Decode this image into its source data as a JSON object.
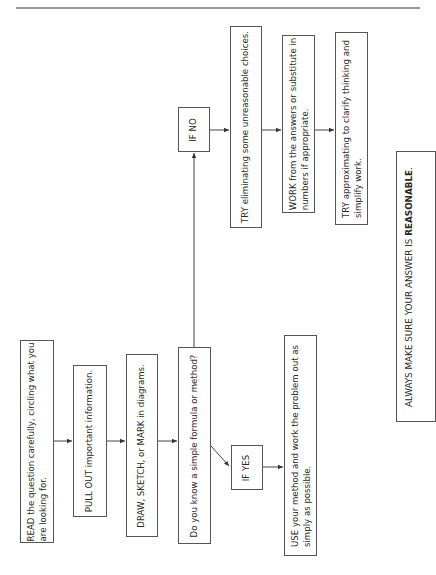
{
  "diagram": {
    "title": "",
    "orientation": "rotated-90-ccw",
    "nodes": [
      {
        "id": "read",
        "lines": [
          "READ the question carefully, circling what you",
          "are looking for."
        ]
      },
      {
        "id": "pull",
        "lines": [
          "PULL OUT important information."
        ]
      },
      {
        "id": "draw",
        "lines": [
          "DRAW, SKETCH, or MARK in diagrams."
        ]
      },
      {
        "id": "know",
        "lines": [
          "Do you know a simple formula or method?"
        ]
      },
      {
        "id": "if_yes",
        "lines": [
          "IF YES"
        ]
      },
      {
        "id": "use",
        "lines": [
          "USE your method and work the problem out as",
          "simply as possible."
        ]
      },
      {
        "id": "if_no",
        "lines": [
          "IF NO"
        ]
      },
      {
        "id": "try_elim",
        "lines": [
          "TRY eliminating some unreasonable choices."
        ]
      },
      {
        "id": "work",
        "lines": [
          "WORK from the answers or substitute in",
          "numbers if appropriate."
        ]
      },
      {
        "id": "try_approx",
        "lines": [
          "TRY approximating to clarify thinking and",
          "simplify work."
        ]
      },
      {
        "id": "always",
        "prefix": "ALWAYS MAKE SURE YOUR ANSWER IS ",
        "emphasis": "REASONABLE",
        "suffix": "."
      }
    ],
    "edges": [
      {
        "from": "read",
        "to": "pull"
      },
      {
        "from": "pull",
        "to": "draw"
      },
      {
        "from": "draw",
        "to": "know"
      },
      {
        "from": "know",
        "to": "if_yes"
      },
      {
        "from": "if_yes",
        "to": "use"
      },
      {
        "from": "know",
        "to": "if_no"
      },
      {
        "from": "if_no",
        "to": "try_elim"
      },
      {
        "from": "try_elim",
        "to": "work"
      },
      {
        "from": "work",
        "to": "try_approx"
      }
    ]
  }
}
